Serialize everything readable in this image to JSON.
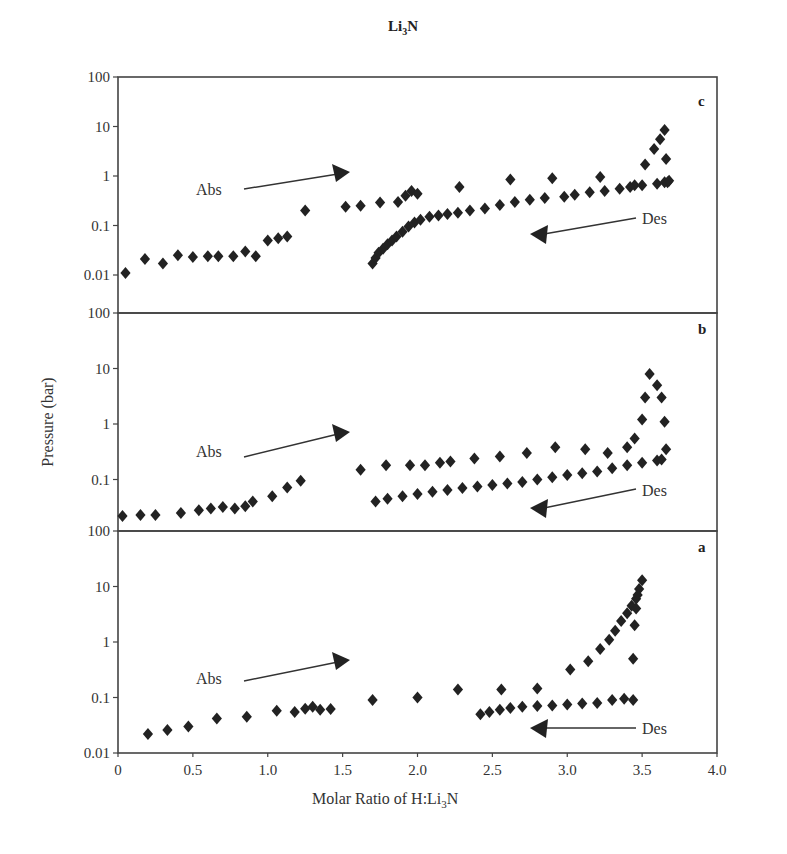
{
  "chart_data": {
    "type": "scatter",
    "title": "Li3N",
    "title_main": "Li",
    "title_sub": "3",
    "title_tail": "N",
    "xlabel": "Molar Ratio of H:Li3N",
    "xlabel_main": "Molar Ratio of H:Li",
    "xlabel_sub": "3",
    "xlabel_tail": "N",
    "ylabel": "Pressure (bar)",
    "xlim": [
      0,
      4.0
    ],
    "xticks": [
      "0",
      "0.5",
      "1.0",
      "1.5",
      "2.0",
      "2.5",
      "3.0",
      "3.5",
      "4.0"
    ],
    "yscale": "log",
    "grid": false,
    "legend": "none",
    "panels": [
      {
        "label": "c",
        "ylim": [
          0.0015,
          100
        ],
        "yticks": [
          "100",
          "10",
          "1",
          "0.1",
          "0.01"
        ],
        "annotations": [
          {
            "text": "Abs",
            "direction": "right"
          },
          {
            "text": "Des",
            "direction": "left"
          }
        ],
        "series": [
          {
            "name": "Abs",
            "points": [
              [
                0.05,
                0.011
              ],
              [
                0.18,
                0.021
              ],
              [
                0.3,
                0.017
              ],
              [
                0.4,
                0.025
              ],
              [
                0.5,
                0.023
              ],
              [
                0.6,
                0.024
              ],
              [
                0.67,
                0.024
              ],
              [
                0.77,
                0.024
              ],
              [
                0.85,
                0.03
              ],
              [
                0.92,
                0.024
              ],
              [
                1.0,
                0.05
              ],
              [
                1.07,
                0.055
              ],
              [
                1.13,
                0.06
              ],
              [
                1.25,
                0.2
              ],
              [
                1.52,
                0.24
              ],
              [
                1.62,
                0.25
              ],
              [
                1.75,
                0.29
              ],
              [
                1.87,
                0.3
              ],
              [
                1.92,
                0.4
              ],
              [
                1.96,
                0.5
              ],
              [
                2.0,
                0.44
              ],
              [
                2.28,
                0.6
              ],
              [
                2.62,
                0.85
              ],
              [
                2.9,
                0.9
              ],
              [
                3.22,
                0.95
              ],
              [
                3.45,
                0.65
              ],
              [
                3.52,
                1.7
              ],
              [
                3.58,
                3.5
              ],
              [
                3.62,
                5.5
              ],
              [
                3.65,
                8.5
              ],
              [
                3.66,
                2.2
              ],
              [
                3.67,
                0.75
              ]
            ]
          },
          {
            "name": "Des",
            "points": [
              [
                1.7,
                0.017
              ],
              [
                1.72,
                0.022
              ],
              [
                1.74,
                0.028
              ],
              [
                1.77,
                0.034
              ],
              [
                1.8,
                0.042
              ],
              [
                1.83,
                0.05
              ],
              [
                1.86,
                0.06
              ],
              [
                1.9,
                0.075
              ],
              [
                1.94,
                0.095
              ],
              [
                1.98,
                0.115
              ],
              [
                2.02,
                0.13
              ],
              [
                2.08,
                0.15
              ],
              [
                2.14,
                0.16
              ],
              [
                2.2,
                0.17
              ],
              [
                2.27,
                0.18
              ],
              [
                2.35,
                0.2
              ],
              [
                2.45,
                0.22
              ],
              [
                2.55,
                0.26
              ],
              [
                2.65,
                0.3
              ],
              [
                2.75,
                0.33
              ],
              [
                2.85,
                0.36
              ],
              [
                2.98,
                0.38
              ],
              [
                3.05,
                0.42
              ],
              [
                3.15,
                0.47
              ],
              [
                3.25,
                0.5
              ],
              [
                3.35,
                0.55
              ],
              [
                3.42,
                0.6
              ],
              [
                3.5,
                0.65
              ],
              [
                3.6,
                0.7
              ],
              [
                3.65,
                0.75
              ],
              [
                3.68,
                0.8
              ]
            ]
          }
        ]
      },
      {
        "label": "b",
        "ylim": [
          0.012,
          100
        ],
        "yticks": [
          "100",
          "10",
          "1",
          "0.1"
        ],
        "annotations": [
          {
            "text": "Abs",
            "direction": "right"
          },
          {
            "text": "Des",
            "direction": "left"
          }
        ],
        "series": [
          {
            "name": "Abs",
            "points": [
              [
                0.03,
                0.022
              ],
              [
                0.15,
                0.023
              ],
              [
                0.25,
                0.023
              ],
              [
                0.42,
                0.025
              ],
              [
                0.54,
                0.028
              ],
              [
                0.62,
                0.03
              ],
              [
                0.7,
                0.032
              ],
              [
                0.78,
                0.03
              ],
              [
                0.85,
                0.033
              ],
              [
                0.9,
                0.04
              ],
              [
                1.03,
                0.05
              ],
              [
                1.13,
                0.072
              ],
              [
                1.22,
                0.095
              ],
              [
                1.62,
                0.15
              ],
              [
                1.79,
                0.18
              ],
              [
                1.95,
                0.18
              ],
              [
                2.05,
                0.18
              ],
              [
                2.15,
                0.2
              ],
              [
                2.22,
                0.21
              ],
              [
                2.38,
                0.24
              ],
              [
                2.55,
                0.26
              ],
              [
                2.73,
                0.3
              ],
              [
                2.92,
                0.38
              ],
              [
                3.12,
                0.35
              ],
              [
                3.27,
                0.3
              ],
              [
                3.4,
                0.38
              ],
              [
                3.45,
                0.55
              ],
              [
                3.5,
                1.2
              ],
              [
                3.52,
                3.0
              ],
              [
                3.55,
                8.0
              ],
              [
                3.6,
                5.0
              ],
              [
                3.63,
                3.0
              ],
              [
                3.65,
                1.1
              ],
              [
                3.66,
                0.35
              ]
            ]
          },
          {
            "name": "Des",
            "points": [
              [
                1.72,
                0.04
              ],
              [
                1.8,
                0.045
              ],
              [
                1.9,
                0.05
              ],
              [
                2.0,
                0.055
              ],
              [
                2.1,
                0.06
              ],
              [
                2.2,
                0.065
              ],
              [
                2.3,
                0.07
              ],
              [
                2.4,
                0.075
              ],
              [
                2.5,
                0.08
              ],
              [
                2.6,
                0.085
              ],
              [
                2.7,
                0.09
              ],
              [
                2.8,
                0.1
              ],
              [
                2.9,
                0.11
              ],
              [
                3.0,
                0.12
              ],
              [
                3.1,
                0.13
              ],
              [
                3.2,
                0.14
              ],
              [
                3.3,
                0.16
              ],
              [
                3.4,
                0.18
              ],
              [
                3.5,
                0.2
              ],
              [
                3.6,
                0.22
              ],
              [
                3.63,
                0.23
              ]
            ]
          }
        ]
      },
      {
        "label": "a",
        "ylim": [
          0.01,
          100
        ],
        "yticks": [
          "100",
          "10",
          "1",
          "0.1",
          "0.01"
        ],
        "annotations": [
          {
            "text": "Abs",
            "direction": "right"
          },
          {
            "text": "Des",
            "direction": "left"
          }
        ],
        "series": [
          {
            "name": "Abs",
            "points": [
              [
                0.2,
                0.022
              ],
              [
                0.33,
                0.026
              ],
              [
                0.47,
                0.03
              ],
              [
                0.66,
                0.042
              ],
              [
                0.86,
                0.045
              ],
              [
                1.06,
                0.058
              ],
              [
                1.18,
                0.055
              ],
              [
                1.25,
                0.063
              ],
              [
                1.3,
                0.068
              ],
              [
                1.35,
                0.06
              ],
              [
                1.42,
                0.062
              ],
              [
                1.7,
                0.09
              ],
              [
                2.0,
                0.1
              ],
              [
                2.27,
                0.14
              ],
              [
                2.56,
                0.14
              ],
              [
                2.8,
                0.145
              ],
              [
                3.02,
                0.32
              ],
              [
                3.14,
                0.45
              ],
              [
                3.22,
                0.75
              ],
              [
                3.28,
                1.1
              ],
              [
                3.32,
                1.6
              ],
              [
                3.36,
                2.4
              ],
              [
                3.4,
                3.3
              ],
              [
                3.43,
                4.5
              ],
              [
                3.46,
                6.0
              ],
              [
                3.48,
                9.0
              ],
              [
                3.5,
                13.0
              ],
              [
                3.47,
                7.0
              ],
              [
                3.46,
                4.0
              ],
              [
                3.45,
                2.0
              ],
              [
                3.44,
                0.5
              ]
            ]
          },
          {
            "name": "Des",
            "points": [
              [
                2.42,
                0.05
              ],
              [
                2.48,
                0.055
              ],
              [
                2.55,
                0.06
              ],
              [
                2.62,
                0.065
              ],
              [
                2.7,
                0.068
              ],
              [
                2.8,
                0.07
              ],
              [
                2.9,
                0.072
              ],
              [
                3.0,
                0.075
              ],
              [
                3.1,
                0.078
              ],
              [
                3.2,
                0.08
              ],
              [
                3.3,
                0.09
              ],
              [
                3.38,
                0.095
              ],
              [
                3.44,
                0.09
              ]
            ]
          }
        ]
      }
    ]
  }
}
